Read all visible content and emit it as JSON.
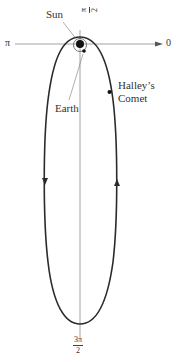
{
  "labels": {
    "sun": "Sun",
    "earth": "Earth",
    "comet_line1": "Halley’s",
    "comet_line2": "Comet",
    "angle_0": "0",
    "angle_pi": "π",
    "angle_pi_over_2": {
      "num": "π",
      "den": "2"
    },
    "angle_3pi_over_2": {
      "num": "3π",
      "den": "2"
    }
  },
  "colors": {
    "orbit": "#2a2a2a",
    "axis": "#8a8a8a",
    "sun": "#111111",
    "text": "#333333"
  },
  "diagram": {
    "orbit_direction": "counterclockwise (up on right side, down on left side)"
  }
}
